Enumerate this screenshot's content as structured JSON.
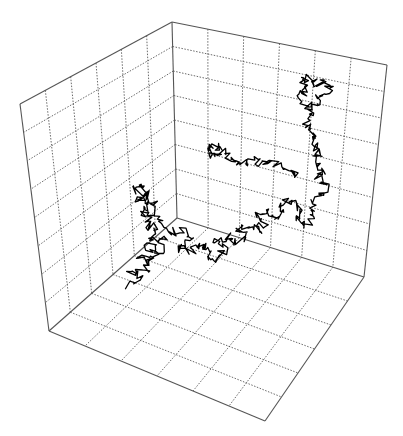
{
  "chart_data": {
    "type": "line",
    "subtype": "3d-random-walk",
    "title": "",
    "xlabel": "",
    "ylabel": "",
    "zlabel": "",
    "grid": true,
    "grid_style": "dotted",
    "panes": {
      "left_wall": {
        "columns": 6,
        "rows": 8
      },
      "right_wall": {
        "columns": 6,
        "rows": 8
      },
      "floor": {
        "columns": 6,
        "rows": 6
      }
    },
    "box_corners_px": {
      "back_top": [
        172,
        22
      ],
      "back_bottom": [
        177,
        218
      ],
      "left_top": [
        20,
        104
      ],
      "left_bottom": [
        49,
        331
      ],
      "right_top": [
        387,
        65
      ],
      "right_bottom": [
        364,
        277
      ],
      "front_bottom": [
        265,
        421
      ]
    },
    "line_color": "#000000",
    "series": [
      {
        "name": "random walk",
        "description": "Brownian path beginning on the lower-left floor region, wandering across the floor, then climbing the right wall to finish near its upper-right area",
        "path_px": [
          [
            130,
            285
          ],
          [
            140,
            278
          ],
          [
            128,
            270
          ],
          [
            145,
            272
          ],
          [
            150,
            262
          ],
          [
            138,
            258
          ],
          [
            155,
            255
          ],
          [
            148,
            246
          ],
          [
            160,
            250
          ],
          [
            165,
            240
          ],
          [
            152,
            236
          ],
          [
            158,
            228
          ],
          [
            145,
            225
          ],
          [
            150,
            215
          ],
          [
            140,
            212
          ],
          [
            148,
            205
          ],
          [
            138,
            200
          ],
          [
            145,
            195
          ],
          [
            135,
            190
          ],
          [
            142,
            185
          ],
          [
            150,
            200
          ],
          [
            156,
            210
          ],
          [
            160,
            222
          ],
          [
            170,
            232
          ],
          [
            182,
            230
          ],
          [
            190,
            240
          ],
          [
            178,
            248
          ],
          [
            192,
            252
          ],
          [
            200,
            244
          ],
          [
            210,
            250
          ],
          [
            205,
            260
          ],
          [
            218,
            258
          ],
          [
            225,
            248
          ],
          [
            215,
            240
          ],
          [
            228,
            236
          ],
          [
            235,
            245
          ],
          [
            245,
            238
          ],
          [
            238,
            228
          ],
          [
            250,
            224
          ],
          [
            258,
            232
          ],
          [
            265,
            222
          ],
          [
            255,
            215
          ],
          [
            268,
            212
          ],
          [
            275,
            220
          ],
          [
            285,
            214
          ],
          [
            278,
            205
          ],
          [
            290,
            200
          ],
          [
            300,
            210
          ],
          [
            295,
            220
          ],
          [
            305,
            226
          ],
          [
            315,
            218
          ],
          [
            310,
            205
          ],
          [
            320,
            198
          ],
          [
            325,
            188
          ],
          [
            318,
            178
          ],
          [
            322,
            168
          ],
          [
            315,
            160
          ],
          [
            320,
            152
          ],
          [
            312,
            145
          ],
          [
            318,
            138
          ],
          [
            310,
            130
          ],
          [
            305,
            120
          ],
          [
            312,
            112
          ],
          [
            306,
            104
          ],
          [
            300,
            96
          ],
          [
            308,
            90
          ],
          [
            302,
            82
          ],
          [
            310,
            78
          ],
          [
            316,
            88
          ],
          [
            322,
            80
          ],
          [
            330,
            86
          ],
          [
            325,
            95
          ],
          [
            318,
            100
          ],
          [
            312,
            110
          ]
        ],
        "branch_px": [
          [
            300,
            178
          ],
          [
            290,
            170
          ],
          [
            280,
            168
          ],
          [
            270,
            160
          ],
          [
            260,
            165
          ],
          [
            250,
            158
          ],
          [
            240,
            166
          ],
          [
            232,
            160
          ],
          [
            222,
            152
          ],
          [
            212,
            156
          ],
          [
            206,
            148
          ],
          [
            214,
            145
          ],
          [
            222,
            150
          ]
        ]
      }
    ]
  },
  "figure": {
    "background": "#ffffff",
    "axis_color": "#555555",
    "grid_color": "#444444"
  }
}
